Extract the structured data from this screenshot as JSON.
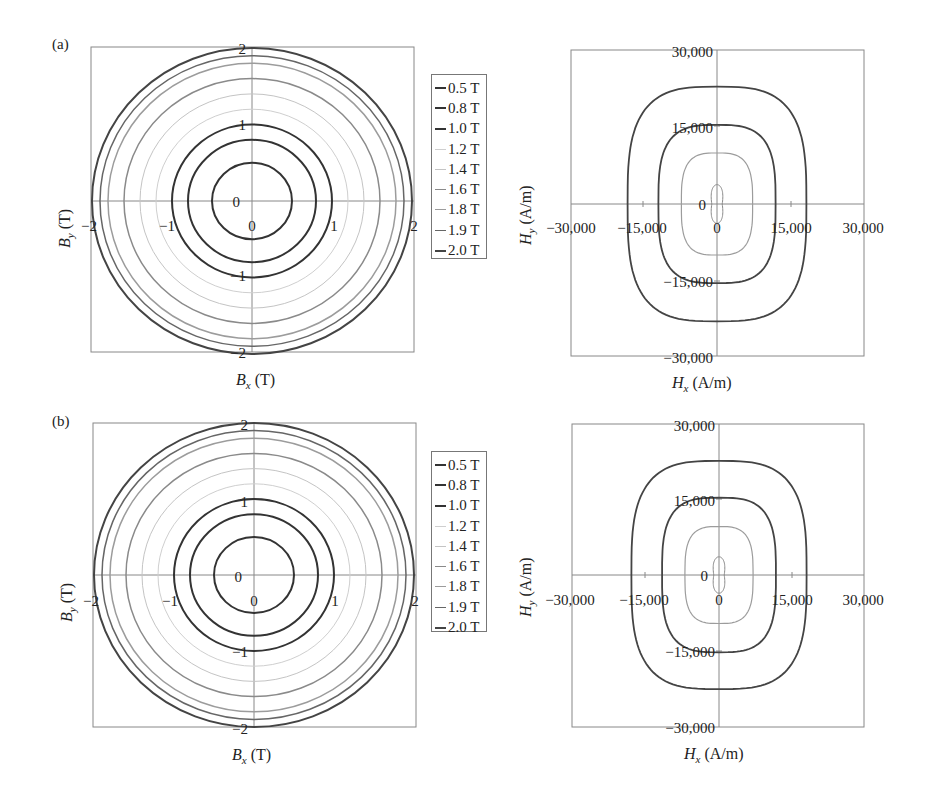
{
  "panels": [
    {
      "id": "a",
      "label": "(a)"
    },
    {
      "id": "b",
      "label": "(b)"
    }
  ],
  "legend": {
    "items": [
      {
        "label": "0.5 T",
        "color": "#333333",
        "width": 2
      },
      {
        "label": "0.8 T",
        "color": "#333333",
        "width": 2
      },
      {
        "label": "1.0 T",
        "color": "#333333",
        "width": 2
      },
      {
        "label": "1.2 T",
        "color": "#cfcfcf",
        "width": 1
      },
      {
        "label": "1.4 T",
        "color": "#c4c4c4",
        "width": 1
      },
      {
        "label": "1.6 T",
        "color": "#8a8a8a",
        "width": 1.5
      },
      {
        "label": "1.8 T",
        "color": "#9c9c9c",
        "width": 1.5
      },
      {
        "label": "1.9 T",
        "color": "#666666",
        "width": 1.5
      },
      {
        "label": "2.0 T",
        "color": "#444444",
        "width": 2
      }
    ]
  },
  "chart_data": [
    {
      "panel": "a",
      "type": "line",
      "subtype": "contour-loci",
      "title": "",
      "xlabel": "B_x (T)",
      "ylabel": "B_y (T)",
      "xlim": [
        -2,
        2
      ],
      "ylim": [
        -2,
        2
      ],
      "x_ticks": [
        "-2",
        "-1",
        "0",
        "1",
        "2"
      ],
      "y_ticks": [
        "-2",
        "-1",
        "0",
        "1",
        "2"
      ],
      "grid": false,
      "legend_position": "right",
      "series": [
        {
          "name": "0.5 T",
          "rx": 0.5,
          "ry": 0.5
        },
        {
          "name": "0.8 T",
          "rx": 0.8,
          "ry": 0.8
        },
        {
          "name": "1.0 T",
          "rx": 1.0,
          "ry": 1.0
        },
        {
          "name": "1.2 T",
          "rx": 1.2,
          "ry": 1.2
        },
        {
          "name": "1.4 T",
          "rx": 1.4,
          "ry": 1.4
        },
        {
          "name": "1.6 T",
          "rx": 1.6,
          "ry": 1.6
        },
        {
          "name": "1.8 T",
          "rx": 1.8,
          "ry": 1.8
        },
        {
          "name": "1.9 T",
          "rx": 1.9,
          "ry": 1.9
        },
        {
          "name": "2.0 T",
          "rx": 2.0,
          "ry": 2.0
        }
      ]
    },
    {
      "panel": "a",
      "type": "line",
      "subtype": "contour-loci",
      "title": "",
      "xlabel": "H_x (A/m)",
      "ylabel": "H_y (A/m)",
      "xlim": [
        -30000,
        30000
      ],
      "ylim": [
        -30000,
        30000
      ],
      "x_ticks": [
        "-30,000",
        "-15,000",
        "0",
        "15,000",
        "30,000"
      ],
      "y_ticks": [
        "-30,000",
        "-15,000",
        "0",
        "15,000",
        "30,000"
      ],
      "grid": false,
      "series": [
        {
          "name": "inner (small)",
          "half_width": 1500,
          "half_height": 3800,
          "shape": "peanut",
          "color": "#8a8a8a"
        },
        {
          "name": "inner",
          "half_width": 7300,
          "half_height": 10000,
          "shape": "rounded-rect",
          "color": "#9c9c9c"
        },
        {
          "name": "middle",
          "half_width": 12000,
          "half_height": 15500,
          "shape": "rounded-rect",
          "color": "#444444"
        },
        {
          "name": "outer",
          "half_width": 18300,
          "half_height": 23000,
          "shape": "rounded-rect",
          "color": "#444444"
        }
      ]
    },
    {
      "panel": "b",
      "type": "line",
      "subtype": "contour-loci",
      "title": "",
      "xlabel": "B_x (T)",
      "ylabel": "B_y (T)",
      "xlim": [
        -2,
        2
      ],
      "ylim": [
        -2,
        2
      ],
      "x_ticks": [
        "-2",
        "-1",
        "0",
        "1",
        "2"
      ],
      "y_ticks": [
        "-2",
        "-1",
        "0",
        "1",
        "2"
      ],
      "grid": false,
      "legend_position": "right",
      "series": [
        {
          "name": "0.5 T",
          "rx": 0.5,
          "ry": 0.5
        },
        {
          "name": "0.8 T",
          "rx": 0.8,
          "ry": 0.8
        },
        {
          "name": "1.0 T",
          "rx": 1.0,
          "ry": 1.0
        },
        {
          "name": "1.2 T",
          "rx": 1.2,
          "ry": 1.2
        },
        {
          "name": "1.4 T",
          "rx": 1.4,
          "ry": 1.4
        },
        {
          "name": "1.6 T",
          "rx": 1.6,
          "ry": 1.6
        },
        {
          "name": "1.8 T",
          "rx": 1.8,
          "ry": 1.8
        },
        {
          "name": "1.9 T",
          "rx": 1.9,
          "ry": 1.9
        },
        {
          "name": "2.0 T",
          "rx": 2.0,
          "ry": 2.0
        }
      ]
    },
    {
      "panel": "b",
      "type": "line",
      "subtype": "contour-loci",
      "title": "",
      "xlabel": "H_x (A/m)",
      "ylabel": "H_y (A/m)",
      "xlim": [
        -30000,
        30000
      ],
      "ylim": [
        -30000,
        30000
      ],
      "x_ticks": [
        "-30,000",
        "-15,000",
        "0",
        "15,000",
        "30,000"
      ],
      "y_ticks": [
        "-30,000",
        "-15,000",
        "0",
        "15,000",
        "30,000"
      ],
      "grid": false,
      "series": [
        {
          "name": "inner (small)",
          "half_width": 1500,
          "half_height": 3600,
          "shape": "peanut",
          "color": "#8a8a8a"
        },
        {
          "name": "inner",
          "half_width": 7000,
          "half_height": 9600,
          "shape": "rounded-rect",
          "color": "#9c9c9c"
        },
        {
          "name": "middle",
          "half_width": 11700,
          "half_height": 15300,
          "shape": "rounded-rect",
          "color": "#444444"
        },
        {
          "name": "outer",
          "half_width": 18000,
          "half_height": 22600,
          "shape": "rounded-rect",
          "color": "#444444"
        }
      ]
    }
  ],
  "axes_text": {
    "b_xlabel_var": "B",
    "b_xlabel_sub": "x",
    "b_ylabel_var": "B",
    "b_ylabel_sub": "y",
    "b_unit": " (T)",
    "h_xlabel_var": "H",
    "h_xlabel_sub": "x",
    "h_ylabel_var": "H",
    "h_ylabel_sub": "y",
    "h_unit": " (A/m)",
    "b_ticks": {
      "pos2": "2",
      "pos1": "1",
      "zero": "0",
      "neg1": "−1",
      "neg2": "−2"
    },
    "h_ticks": {
      "pos30": "30,000",
      "pos15": "15,000",
      "zero": "0",
      "neg15": "−15,000",
      "neg30": "−30,000"
    }
  }
}
